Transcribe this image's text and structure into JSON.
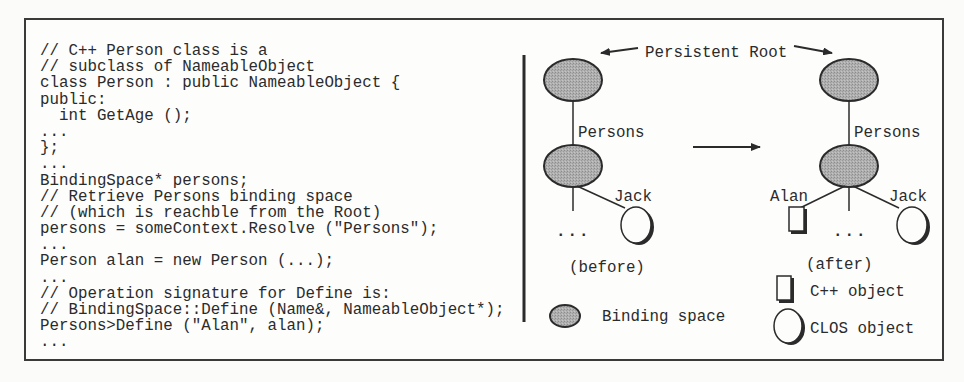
{
  "figure": {
    "code_panel": {
      "lines": [
        "// C++ Person class is a",
        "// subclass of NameableObject",
        "class Person : public NameableObject {",
        "public:",
        "  int GetAge ();",
        "...",
        "};",
        "...",
        "BindingSpace* persons;",
        "// Retrieve Persons binding space",
        "// (which is reachble from the Root)",
        "persons = someContext.Resolve (\"Persons\");",
        "...",
        "Person alan = new Person (...);",
        "...",
        "// Operation signature for Define is:",
        "// BindingSpace::Define (Name&, NameableObject*);",
        "Persons>Define (\"Alan\", alan);",
        "..."
      ]
    },
    "diagram": {
      "root_label": "Persistent Root",
      "before": {
        "caption": "(before)",
        "edge_label": "Persons",
        "child_label": "Jack",
        "ellipsis": "..."
      },
      "after": {
        "caption": "(after)",
        "edge_label": "Persons",
        "child_labels": [
          "Alan",
          "Jack"
        ],
        "ellipsis": "..."
      },
      "legend": {
        "binding_space": "Binding space",
        "cpp_object": "C++ object",
        "clos_object": "CLOS object"
      },
      "colors": {
        "binding_space_fill": "#a9a9a9",
        "stroke": "#2b2b2b",
        "frame": "#3a3a3a"
      }
    }
  }
}
